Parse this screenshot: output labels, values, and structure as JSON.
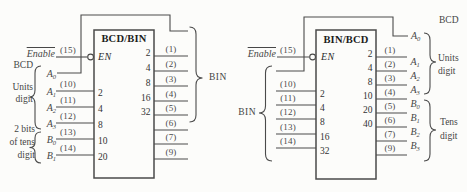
{
  "colors": {
    "line": "#4a4a4a",
    "text": "#3d3d3d",
    "background": "#fcfcfa"
  },
  "left": {
    "title": "BCD/BIN",
    "enable_label": "Enable",
    "enable_pin": "(15)",
    "en_label": "EN",
    "units_caption": [
      "BCD",
      "Units",
      "digit"
    ],
    "tens_caption": [
      "2 bits",
      "of tens",
      "digit"
    ],
    "inputs": [
      {
        "base": "A",
        "sub": "0",
        "pin": "",
        "weight": ""
      },
      {
        "base": "A",
        "sub": "1",
        "pin": "(10)",
        "weight": "2"
      },
      {
        "base": "A",
        "sub": "2",
        "pin": "(11)",
        "weight": "4"
      },
      {
        "base": "A",
        "sub": "3",
        "pin": "(12)",
        "weight": "8"
      },
      {
        "base": "B",
        "sub": "0",
        "pin": "(13)",
        "weight": "10"
      },
      {
        "base": "B",
        "sub": "1",
        "pin": "(14)",
        "weight": "20"
      }
    ],
    "outputs": [
      {
        "pin": "(1)",
        "weight": "2"
      },
      {
        "pin": "(2)",
        "weight": "4"
      },
      {
        "pin": "(3)",
        "weight": "8"
      },
      {
        "pin": "(4)",
        "weight": "16"
      },
      {
        "pin": "(5)",
        "weight": "32"
      },
      {
        "pin": "(6)",
        "weight": ""
      },
      {
        "pin": "(7)",
        "weight": ""
      },
      {
        "pin": "(9)",
        "weight": ""
      }
    ],
    "output_group_label": "BIN"
  },
  "right": {
    "title": "BIN/BCD",
    "enable_label": "Enable",
    "enable_pin": "(15)",
    "en_label": "EN",
    "input_group_label": "BIN",
    "inputs": [
      {
        "pin": "(10)",
        "weight": "2"
      },
      {
        "pin": "(11)",
        "weight": "4"
      },
      {
        "pin": "(12)",
        "weight": "8"
      },
      {
        "pin": "(13)",
        "weight": "16"
      },
      {
        "pin": "(14)",
        "weight": "32"
      }
    ],
    "bcd_caption": "BCD",
    "bypass_label": {
      "base": "A",
      "sub": "0"
    },
    "outputs": [
      {
        "pin": "(1)",
        "weight": "2",
        "base": "A",
        "sub": "1"
      },
      {
        "pin": "(2)",
        "weight": "4",
        "base": "A",
        "sub": "2"
      },
      {
        "pin": "(3)",
        "weight": "8",
        "base": "A",
        "sub": "3"
      },
      {
        "pin": "(4)",
        "weight": "10",
        "base": "B",
        "sub": "0"
      },
      {
        "pin": "(5)",
        "weight": "20",
        "base": "B",
        "sub": "1"
      },
      {
        "pin": "(6)",
        "weight": "40",
        "base": "B",
        "sub": "2"
      },
      {
        "pin": "(7)",
        "weight": "",
        "base": "B",
        "sub": "3"
      },
      {
        "pin": "(9)",
        "weight": "",
        "base": "",
        "sub": ""
      }
    ],
    "units_caption": [
      "Units",
      "digit"
    ],
    "tens_caption": [
      "Tens",
      "digit"
    ]
  }
}
